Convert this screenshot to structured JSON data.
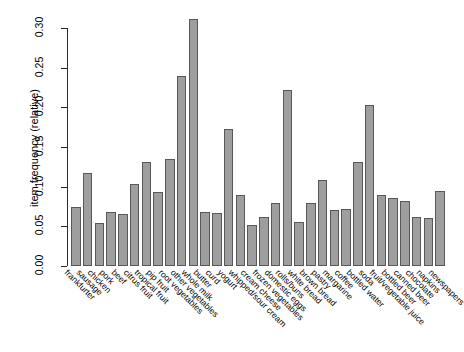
{
  "chart_data": {
    "type": "bar",
    "title": "",
    "subtitle": "",
    "xlabel": "",
    "ylabel": "item frequency (relative)",
    "ylim": [
      0.0,
      0.315
    ],
    "yticks": [
      "0.00",
      "0.05",
      "0.10",
      "0.15",
      "0.20",
      "0.25",
      "0.30"
    ],
    "ytick_values": [
      0.0,
      0.05,
      0.1,
      0.15,
      0.2,
      0.25,
      0.3
    ],
    "grid": false,
    "legend": null,
    "bar_color": "#9e9e9e",
    "bar_border_color": "#585858",
    "categories": [
      "frankfurter",
      "sausage",
      "chicken",
      "pork",
      "beef",
      "citrus fruit",
      "tropical fruit",
      "pip fruit",
      "root vegetables",
      "other vegetables",
      "whole milk",
      "butter",
      "curd",
      "yogurt",
      "whipped/sour cream",
      "cream cheese",
      "frozen vegetables",
      "domestic eggs",
      "rolls/buns",
      "white bread",
      "brown bread",
      "pastry",
      "margarine",
      "coffee",
      "bottled water",
      "soda",
      "fruit/vegetable juice",
      "bottled beer",
      "canned beer",
      "chocolate",
      "napkins",
      "newspapers"
    ],
    "values": [
      0.074,
      0.117,
      0.054,
      0.068,
      0.065,
      0.104,
      0.131,
      0.093,
      0.135,
      0.24,
      0.311,
      0.068,
      0.067,
      0.173,
      0.089,
      0.052,
      0.062,
      0.08,
      0.222,
      0.055,
      0.079,
      0.109,
      0.071,
      0.072,
      0.131,
      0.203,
      0.089,
      0.086,
      0.082,
      0.062,
      0.061,
      0.094
    ]
  }
}
